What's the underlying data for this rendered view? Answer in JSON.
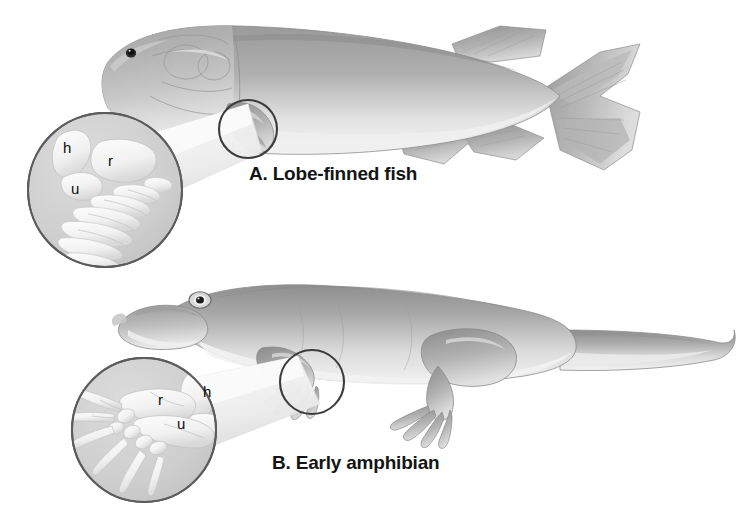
{
  "figure": {
    "background_color": "#ffffff"
  },
  "panels": [
    {
      "id": "A",
      "caption": "A. Lobe-finned fish",
      "subject": "lobe-finned fish",
      "callout": {
        "source_region": "pectoral fin",
        "magnified": true
      },
      "bone_labels": [
        {
          "key": "h",
          "label": "h",
          "bone": "humerus"
        },
        {
          "key": "r",
          "label": "r",
          "bone": "radius"
        },
        {
          "key": "u",
          "label": "u",
          "bone": "ulna"
        }
      ]
    },
    {
      "id": "B",
      "caption": "B. Early amphibian",
      "subject": "early amphibian",
      "callout": {
        "source_region": "forelimb",
        "magnified": true
      },
      "bone_labels": [
        {
          "key": "r",
          "label": "r",
          "bone": "radius"
        },
        {
          "key": "h",
          "label": "h",
          "bone": "humerus"
        },
        {
          "key": "u",
          "label": "u",
          "bone": "ulna"
        }
      ]
    }
  ],
  "colors": {
    "body_gray": "#a9a9a9",
    "body_light": "#e8e8e8",
    "body_shadow": "#8a8a8a",
    "fin_gray": "#9c9c9c",
    "inset_fill": "#cfcfcf",
    "inset_stroke": "#5a5a5a",
    "bone_white": "#f6f6f6",
    "bone_shade": "#d6d6d6",
    "outline": "#6f6f6f",
    "caption_text": "#141414",
    "label_text": "#0c0c0c",
    "eye_dark": "#1f1f1f"
  }
}
